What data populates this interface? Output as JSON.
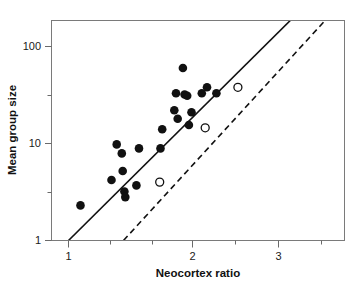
{
  "chart_data": {
    "type": "scatter",
    "title": "",
    "xlabel": "Neocortex ratio",
    "ylabel": "Mean group size",
    "xscale": "linear",
    "yscale": "log",
    "xlim": [
      0.9,
      3.6
    ],
    "ylim": [
      1,
      200
    ],
    "grid": false,
    "legend": "none",
    "xticks": [
      1,
      2,
      3
    ],
    "xticklabels": [
      "1",
      "2",
      "3"
    ],
    "xminorticks": [
      1.5,
      2.5,
      3.5
    ],
    "yticks": [
      1,
      10,
      100
    ],
    "yticklabels": [
      "1",
      "10",
      "100"
    ],
    "yminorticks": [
      3.5,
      35
    ],
    "series": [
      {
        "name": "filled-circles",
        "marker": "filled-circle",
        "color": "#111111",
        "points": [
          {
            "x": 1.14,
            "y": 2.3
          },
          {
            "x": 1.5,
            "y": 4.2
          },
          {
            "x": 1.56,
            "y": 9.8
          },
          {
            "x": 1.62,
            "y": 7.9
          },
          {
            "x": 1.63,
            "y": 5.2
          },
          {
            "x": 1.65,
            "y": 3.2
          },
          {
            "x": 1.66,
            "y": 2.8
          },
          {
            "x": 1.79,
            "y": 3.7
          },
          {
            "x": 1.82,
            "y": 8.9
          },
          {
            "x": 2.07,
            "y": 8.9
          },
          {
            "x": 2.09,
            "y": 14.0
          },
          {
            "x": 2.23,
            "y": 22.0
          },
          {
            "x": 2.25,
            "y": 33.0
          },
          {
            "x": 2.27,
            "y": 18.0
          },
          {
            "x": 2.33,
            "y": 60.0
          },
          {
            "x": 2.35,
            "y": 32.0
          },
          {
            "x": 2.38,
            "y": 31.0
          },
          {
            "x": 2.4,
            "y": 15.5
          },
          {
            "x": 2.43,
            "y": 21.0
          },
          {
            "x": 2.55,
            "y": 33.0
          },
          {
            "x": 2.61,
            "y": 38.0
          },
          {
            "x": 2.72,
            "y": 33.0
          }
        ]
      },
      {
        "name": "open-circles",
        "marker": "open-circle",
        "color": "#111111",
        "points": [
          {
            "x": 2.06,
            "y": 4.0
          },
          {
            "x": 2.59,
            "y": 14.5
          },
          {
            "x": 2.97,
            "y": 38.0
          }
        ]
      }
    ],
    "lines": [
      {
        "name": "solid-regression-line",
        "style": "solid",
        "x1": 1.0,
        "y1": 1.0,
        "x2": 3.8,
        "y2": 290.0
      },
      {
        "name": "dashed-regression-line",
        "style": "dashed",
        "x1": 1.64,
        "y1": 1.0,
        "x2": 4.2,
        "y2": 300.0
      }
    ]
  }
}
